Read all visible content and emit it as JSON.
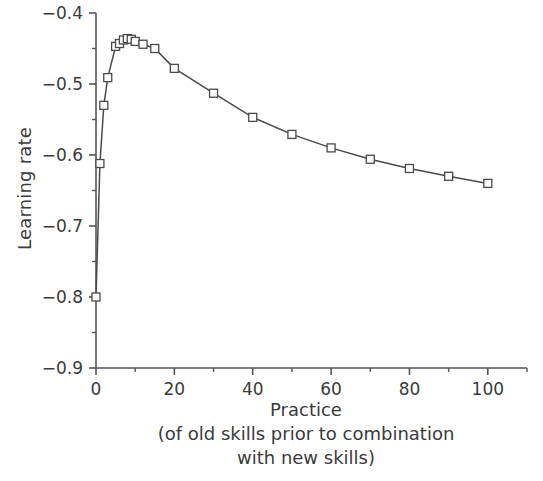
{
  "chart_data": {
    "type": "line",
    "title": "",
    "xlabel": "Practice",
    "xlabel_sub1": "(of old skills prior to combination",
    "xlabel_sub2": "with new skills)",
    "ylabel": "Learning rate",
    "xlim": [
      0,
      110
    ],
    "ylim": [
      -0.9,
      -0.4
    ],
    "grid": false,
    "legend": "none",
    "x_major_ticks": [
      0,
      20,
      40,
      60,
      80,
      100
    ],
    "x_major_tick_labels": [
      "0",
      "20",
      "40",
      "60",
      "80",
      "100"
    ],
    "x_minor_ticks": [
      10,
      30,
      50,
      70,
      90,
      110
    ],
    "y_major_ticks": [
      -0.4,
      -0.5,
      -0.6,
      -0.7,
      -0.8,
      -0.9
    ],
    "y_major_tick_labels": [
      "−0.4",
      "−0.5",
      "−0.6",
      "−0.7",
      "−0.8",
      "−0.9"
    ],
    "y_minor_ticks": [
      -0.45,
      -0.55,
      -0.65,
      -0.75,
      -0.85
    ],
    "marker": "square-open",
    "line_color": "#4a4a4a",
    "marker_edge_color": "#4a4a4a",
    "marker_face_color": "#ffffff",
    "series": [
      {
        "name": "Learning rate",
        "x": [
          0,
          1,
          2,
          3,
          5,
          6,
          7,
          8,
          9,
          10,
          12,
          15,
          20,
          30,
          40,
          50,
          60,
          70,
          80,
          90,
          100
        ],
        "y": [
          -0.8,
          -0.612,
          -0.53,
          -0.491,
          -0.447,
          -0.443,
          -0.438,
          -0.436,
          -0.437,
          -0.44,
          -0.444,
          -0.45,
          -0.478,
          -0.513,
          -0.547,
          -0.571,
          -0.59,
          -0.606,
          -0.619,
          -0.63,
          -0.64
        ]
      }
    ]
  }
}
